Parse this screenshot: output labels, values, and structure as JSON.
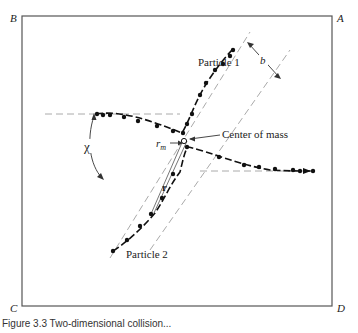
{
  "diagram": {
    "type": "scattering-trajectory",
    "corners": {
      "A": "A",
      "B": "B",
      "C": "C",
      "D": "D"
    },
    "labels": {
      "particle1": "Particle 1",
      "particle2": "Particle 2",
      "center_of_mass": "Center of mass",
      "impact_parameter": "b",
      "deflection_angle": "χ",
      "rm": "r",
      "rm_sub": "m",
      "r": "r"
    },
    "caption": "Figure 3.3  Two-dimensional collision..."
  }
}
